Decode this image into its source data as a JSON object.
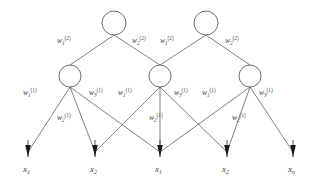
{
  "figure": {
    "type": "neural-network-diagram",
    "colors": {
      "background": "#ffffff",
      "edge": "#4a4a4a",
      "node_stroke": "#4a4a4a",
      "node_fill": "#ffffff",
      "arrow": "#1a1a1a",
      "text": "#3d3d3d"
    }
  },
  "layers": {
    "output": {
      "name": "layer-2-nodes",
      "count": 2,
      "nodes": [
        {
          "id": "out-1",
          "cx": 114,
          "cy": 23,
          "r": 12
        },
        {
          "id": "out-2",
          "cx": 206,
          "cy": 23,
          "r": 12
        }
      ]
    },
    "hidden": {
      "name": "layer-1-nodes",
      "count": 3,
      "nodes": [
        {
          "id": "hid-1",
          "cx": 70,
          "cy": 76,
          "r": 11
        },
        {
          "id": "hid-2",
          "cx": 160,
          "cy": 76,
          "r": 11
        },
        {
          "id": "hid-3",
          "cx": 250,
          "cy": 76,
          "r": 11
        }
      ]
    },
    "input": {
      "name": "input-arrows",
      "count": 5,
      "nodes": [
        {
          "id": "in-1",
          "x": 28,
          "tip_y": 157
        },
        {
          "id": "in-2",
          "x": 95,
          "tip_y": 157
        },
        {
          "id": "in-3",
          "x": 160,
          "tip_y": 157
        },
        {
          "id": "in-4",
          "x": 227,
          "tip_y": 157
        },
        {
          "id": "in-5",
          "x": 293,
          "tip_y": 157
        }
      ]
    }
  },
  "input_labels": [
    {
      "base": "x",
      "sub": "1",
      "x": 28,
      "y": 170
    },
    {
      "base": "x",
      "sub": "2",
      "x": 95,
      "y": 170
    },
    {
      "base": "x",
      "sub": "1",
      "x": 160,
      "y": 170
    },
    {
      "base": "x",
      "sub": "2",
      "x": 227,
      "y": 170
    },
    {
      "base": "x",
      "sub": "n",
      "x": 293,
      "y": 170
    }
  ],
  "layer2_weight_labels": [
    {
      "base": "w",
      "sub": "1",
      "sup": "(2)",
      "x": 64,
      "y": 42
    },
    {
      "base": "w",
      "sub": "2",
      "sup": "(2)",
      "x": 139,
      "y": 42
    },
    {
      "base": "w",
      "sub": "1",
      "sup": "(2)",
      "x": 167,
      "y": 42
    },
    {
      "base": "w",
      "sub": "2",
      "sup": "(2)",
      "x": 231,
      "y": 42
    }
  ],
  "layer1_weight_labels": [
    {
      "base": "w",
      "sub": "1",
      "sup": "(1)",
      "x": 29,
      "y": 93
    },
    {
      "base": "w",
      "sub": "2",
      "sup": "(1)",
      "x": 63,
      "y": 118
    },
    {
      "base": "w",
      "sub": "3",
      "sup": "(1)",
      "x": 95,
      "y": 93
    },
    {
      "base": "w",
      "sub": "1",
      "sup": "(1)",
      "x": 124,
      "y": 93
    },
    {
      "base": "w",
      "sub": "2",
      "sup": "(1)",
      "x": 155,
      "y": 118
    },
    {
      "base": "w",
      "sub": "3",
      "sup": "(1)",
      "x": 180,
      "y": 93
    },
    {
      "base": "w",
      "sub": "1",
      "sup": "(1)",
      "x": 208,
      "y": 93
    },
    {
      "base": "w",
      "sub": "2",
      "sup": "(1)",
      "x": 238,
      "y": 118
    },
    {
      "base": "w",
      "sub": "3",
      "sup": "(1)",
      "x": 265,
      "y": 93
    }
  ],
  "edges": {
    "layer2": [
      {
        "from": "out-1",
        "to": "hid-1"
      },
      {
        "from": "out-1",
        "to": "hid-2"
      },
      {
        "from": "out-2",
        "to": "hid-2"
      },
      {
        "from": "out-2",
        "to": "hid-3"
      }
    ],
    "layer1": [
      {
        "from": "hid-1",
        "to": "in-1"
      },
      {
        "from": "hid-1",
        "to": "in-2"
      },
      {
        "from": "hid-1",
        "to": "in-3"
      },
      {
        "from": "hid-2",
        "to": "in-2"
      },
      {
        "from": "hid-2",
        "to": "in-3"
      },
      {
        "from": "hid-2",
        "to": "in-4"
      },
      {
        "from": "hid-3",
        "to": "in-3"
      },
      {
        "from": "hid-3",
        "to": "in-4"
      },
      {
        "from": "hid-3",
        "to": "in-5"
      }
    ]
  }
}
